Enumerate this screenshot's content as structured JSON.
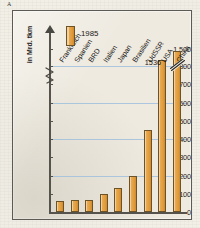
{
  "corner_mark": "A",
  "legend": {
    "swatch_name": "bar-swatch",
    "label": "1985"
  },
  "axis": {
    "y_caption": "in Mrd. tkm",
    "break_symbol": "zigzag"
  },
  "china_callout": "1536",
  "chart_data": {
    "type": "bar",
    "title": "",
    "subtitle": "",
    "xlabel": "",
    "ylabel": "in Mrd. tkm",
    "legend_entries": [
      "1985"
    ],
    "legend_position": "top-left",
    "grid": true,
    "grid_axis": "y",
    "axis_break": {
      "below": 800,
      "above": 1500
    },
    "ylim": [
      0,
      900
    ],
    "yticks": [
      0,
      100,
      200,
      300,
      400,
      500,
      600,
      700,
      800,
      1500
    ],
    "ytick_labels": [
      "0",
      "100",
      "200",
      "300",
      "400",
      "500",
      "600",
      "700",
      "800",
      "1 500"
    ],
    "categories": [
      "Frankreich",
      "Spanien",
      "BRD",
      "Italien",
      "Japan",
      "Brasilien",
      "UdSSR",
      "USA",
      "China"
    ],
    "values": [
      60,
      65,
      65,
      100,
      130,
      200,
      450,
      810,
      1536
    ],
    "data_labels": [
      "",
      "",
      "",
      "",
      "",
      "",
      "",
      "",
      "1536"
    ],
    "annotations": [
      {
        "text": "1536",
        "target": "China",
        "note": "bar is truncated with a break slash"
      }
    ]
  }
}
